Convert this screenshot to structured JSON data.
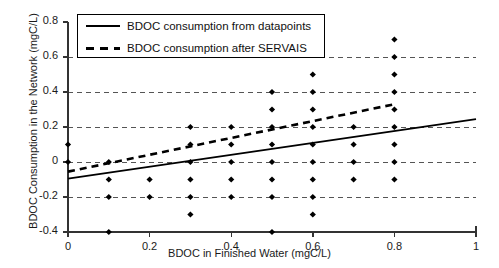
{
  "chart_data": {
    "type": "scatter",
    "title": "",
    "xlabel": "BDOC in Finished Water (mgC/L)",
    "ylabel": "BDOC Consumption in the Network (mgC/L)",
    "xlim": [
      0,
      1
    ],
    "ylim": [
      -0.4,
      0.8
    ],
    "xticks": [
      "0",
      "0.2",
      "0.4",
      "0.6",
      "0.8",
      "1"
    ],
    "xtick_values": [
      0,
      0.2,
      0.4,
      0.6,
      0.8,
      1
    ],
    "yticks": [
      "0.8",
      "0.6",
      "0.4",
      "0.2",
      "0",
      "-0.2",
      "-0.4"
    ],
    "ytick_values": [
      0.8,
      0.6,
      0.4,
      0.2,
      0,
      -0.2,
      -0.4
    ],
    "grid": "horizontal-dashed",
    "legend_position": "top-left",
    "legend": [
      {
        "label": "BDOC consumption from datapoints",
        "style": "solid"
      },
      {
        "label": "BDOC consumption after SERVAIS",
        "style": "dashed"
      }
    ],
    "series": [
      {
        "name": "datapoints",
        "type": "scatter",
        "marker": "diamond",
        "color": "#000000",
        "points": [
          [
            0.0,
            0.1
          ],
          [
            0.0,
            0.0
          ],
          [
            0.1,
            0.0
          ],
          [
            0.1,
            -0.1
          ],
          [
            0.1,
            -0.2
          ],
          [
            0.1,
            -0.4
          ],
          [
            0.2,
            -0.1
          ],
          [
            0.2,
            -0.2
          ],
          [
            0.3,
            0.2
          ],
          [
            0.3,
            0.1
          ],
          [
            0.3,
            0.0
          ],
          [
            0.3,
            -0.1
          ],
          [
            0.3,
            -0.2
          ],
          [
            0.3,
            -0.3
          ],
          [
            0.4,
            0.2
          ],
          [
            0.4,
            0.1
          ],
          [
            0.4,
            0.0
          ],
          [
            0.4,
            -0.1
          ],
          [
            0.4,
            -0.2
          ],
          [
            0.5,
            0.4
          ],
          [
            0.5,
            0.3
          ],
          [
            0.5,
            0.2
          ],
          [
            0.5,
            0.1
          ],
          [
            0.5,
            0.0
          ],
          [
            0.5,
            -0.1
          ],
          [
            0.5,
            -0.2
          ],
          [
            0.5,
            -0.4
          ],
          [
            0.6,
            0.5
          ],
          [
            0.6,
            0.4
          ],
          [
            0.6,
            0.3
          ],
          [
            0.6,
            0.2
          ],
          [
            0.6,
            0.1
          ],
          [
            0.6,
            0.0
          ],
          [
            0.6,
            -0.1
          ],
          [
            0.6,
            -0.2
          ],
          [
            0.6,
            -0.3
          ],
          [
            0.7,
            0.2
          ],
          [
            0.7,
            0.1
          ],
          [
            0.7,
            0.0
          ],
          [
            0.7,
            -0.1
          ],
          [
            0.8,
            0.7
          ],
          [
            0.8,
            0.6
          ],
          [
            0.8,
            0.5
          ],
          [
            0.8,
            0.4
          ],
          [
            0.8,
            0.3
          ],
          [
            0.8,
            0.2
          ],
          [
            0.8,
            0.1
          ],
          [
            0.8,
            0.0
          ],
          [
            0.8,
            -0.1
          ]
        ]
      },
      {
        "name": "BDOC consumption from datapoints",
        "type": "line",
        "style": "solid",
        "color": "#000000",
        "x": [
          0,
          1
        ],
        "y": [
          -0.095,
          0.245
        ]
      },
      {
        "name": "BDOC consumption after SERVAIS",
        "type": "line",
        "style": "dashed",
        "color": "#000000",
        "x": [
          0,
          0.8
        ],
        "y": [
          -0.055,
          0.33
        ]
      }
    ]
  }
}
